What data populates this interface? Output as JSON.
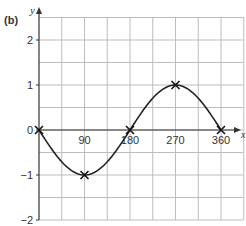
{
  "part_label": "(b)",
  "chart_data": {
    "type": "line",
    "title": "",
    "xlabel": "x",
    "ylabel": "y",
    "x_ticks": [
      90,
      180,
      270,
      360
    ],
    "y_ticks": [
      2,
      1,
      0,
      -1,
      -2
    ],
    "xlim": [
      0,
      405
    ],
    "ylim": [
      -2,
      2.5
    ],
    "grid": true,
    "series": [
      {
        "name": "y = -sin x",
        "x": [
          0,
          90,
          180,
          270,
          360
        ],
        "values": [
          0,
          -1,
          0,
          1,
          0
        ]
      }
    ],
    "marked_points": [
      [
        0,
        0
      ],
      [
        90,
        -1
      ],
      [
        180,
        0
      ],
      [
        270,
        1
      ],
      [
        360,
        0
      ]
    ]
  },
  "colors": {
    "grid": "#bdbdbd",
    "axis": "#333333",
    "curve": "#222222"
  }
}
